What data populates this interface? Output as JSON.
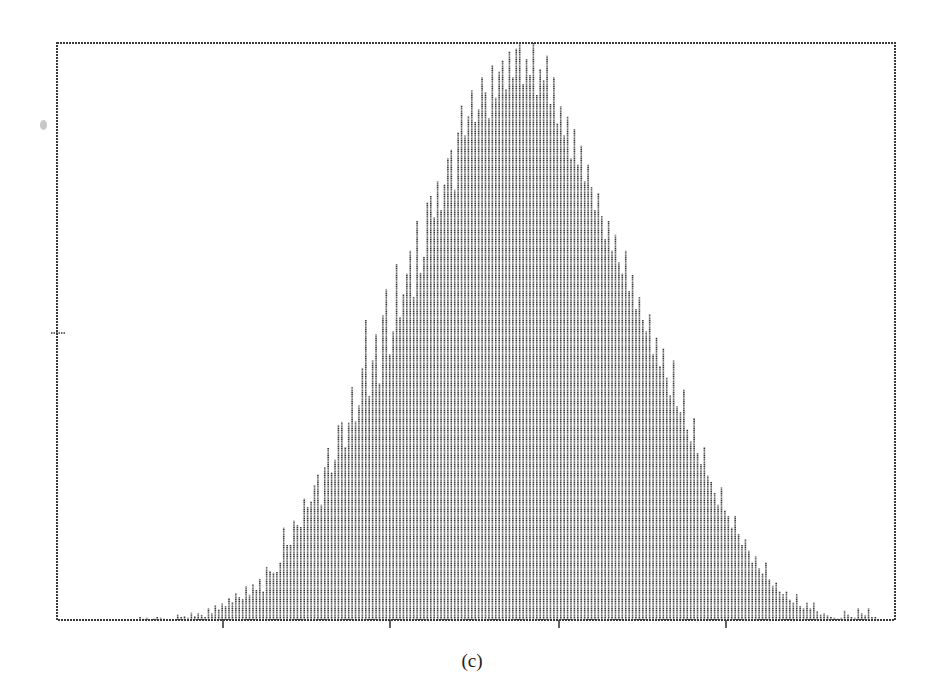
{
  "caption": "(c)",
  "chart_data": {
    "type": "bar",
    "title": "",
    "subtitle": "",
    "xlabel": "",
    "ylabel": "",
    "caption": "(c)",
    "grid": false,
    "legend": null,
    "x_tick_labels": [
      "",
      "",
      "",
      ""
    ],
    "y_tick_labels": [
      ""
    ],
    "ylim": [
      0,
      1
    ],
    "plot_box": {
      "left": 57,
      "top": 43,
      "right": 895,
      "bottom": 620
    },
    "x_ticks_px": [
      223,
      390,
      559,
      726
    ],
    "y_ticks_px": [
      333
    ],
    "bar_spacing_px": 3.42,
    "first_bar_px": 58,
    "values": [
      0,
      0,
      0,
      0,
      0,
      0,
      0,
      0,
      0,
      0,
      0,
      0,
      0,
      0,
      0,
      0,
      0,
      0,
      0,
      0,
      0,
      0,
      0,
      0,
      0.005,
      0.003,
      0.004,
      0,
      0.003,
      0.006,
      0.004,
      0.003,
      0,
      0,
      0,
      0.01,
      0.005,
      0.007,
      0.004,
      0.013,
      0.007,
      0.012,
      0.009,
      0.006,
      0.02,
      0.012,
      0.026,
      0.018,
      0.029,
      0.024,
      0.038,
      0.031,
      0.046,
      0.04,
      0.036,
      0.058,
      0.044,
      0.062,
      0.052,
      0.072,
      0.05,
      0.092,
      0.085,
      0.082,
      0.083,
      0.1,
      0.16,
      0.13,
      0.13,
      0.172,
      0.164,
      0.162,
      0.21,
      0.196,
      0.205,
      0.233,
      0.252,
      0.2,
      0.265,
      0.298,
      0.256,
      0.278,
      0.338,
      0.343,
      0.3,
      0.342,
      0.404,
      0.344,
      0.372,
      0.436,
      0.52,
      0.388,
      0.45,
      0.495,
      0.41,
      0.528,
      0.574,
      0.46,
      0.5,
      0.618,
      0.525,
      0.565,
      0.6,
      0.64,
      0.56,
      0.692,
      0.602,
      0.63,
      0.724,
      0.735,
      0.698,
      0.76,
      0.71,
      0.755,
      0.8,
      0.815,
      0.746,
      0.845,
      0.892,
      0.84,
      0.873,
      0.918,
      0.864,
      0.885,
      0.94,
      0.915,
      0.87,
      0.962,
      0.905,
      0.95,
      0.97,
      0.92,
      0.985,
      0.94,
      0.99,
      1.0,
      0.93,
      0.972,
      0.945,
      1.0,
      0.91,
      0.955,
      0.935,
      0.978,
      0.895,
      0.94,
      0.86,
      0.89,
      0.84,
      0.872,
      0.8,
      0.852,
      0.79,
      0.822,
      0.76,
      0.79,
      0.75,
      0.71,
      0.74,
      0.7,
      0.66,
      0.692,
      0.64,
      0.668,
      0.62,
      0.6,
      0.64,
      0.57,
      0.598,
      0.54,
      0.56,
      0.52,
      0.5,
      0.53,
      0.46,
      0.49,
      0.44,
      0.47,
      0.42,
      0.39,
      0.45,
      0.37,
      0.36,
      0.4,
      0.33,
      0.31,
      0.35,
      0.29,
      0.27,
      0.3,
      0.25,
      0.24,
      0.22,
      0.2,
      0.23,
      0.19,
      0.18,
      0.16,
      0.18,
      0.15,
      0.13,
      0.14,
      0.12,
      0.1,
      0.11,
      0.09,
      0.08,
      0.1,
      0.07,
      0.06,
      0.065,
      0.05,
      0.045,
      0.05,
      0.035,
      0.03,
      0.045,
      0.025,
      0.02,
      0.03,
      0.02,
      0.03,
      0.015,
      0.01,
      0.012,
      0.008,
      0.005,
      0.004,
      0.003,
      0.004,
      0.016,
      0.01,
      0.006,
      0.004,
      0.02,
      0.012,
      0.008,
      0.02,
      0.005,
      0.006,
      0,
      0,
      0,
      0,
      0,
      0,
      0,
      0.005,
      0,
      0,
      0,
      0,
      0,
      0,
      0,
      0,
      0,
      0,
      0.004,
      0,
      0,
      0,
      0,
      0,
      0,
      0,
      0,
      0,
      0,
      0
    ]
  }
}
